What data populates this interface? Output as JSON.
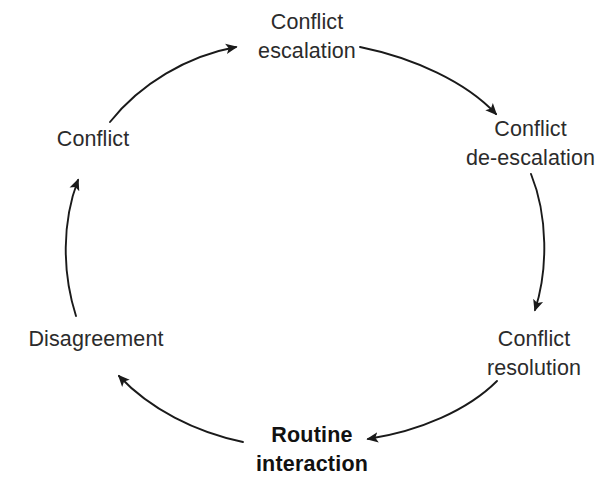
{
  "diagram": {
    "type": "cycle",
    "direction": "clockwise",
    "background_color": "#ffffff",
    "stroke_color": "#1a1a1a",
    "text_color": "#2b2b2b",
    "emphasis_text_color": "#111111",
    "nodes": [
      {
        "id": "routine-interaction",
        "lines": [
          "Routine",
          "interaction"
        ],
        "emphasis": true,
        "position": "bottom"
      },
      {
        "id": "conflict",
        "lines": [
          "Conflict"
        ],
        "emphasis": false,
        "position": "upper-left"
      },
      {
        "id": "conflict-escalation",
        "lines": [
          "Conflict",
          "escalation"
        ],
        "emphasis": false,
        "position": "top"
      },
      {
        "id": "conflict-de-escalation",
        "lines": [
          "Conflict",
          "de-escalation"
        ],
        "emphasis": false,
        "position": "upper-right"
      },
      {
        "id": "conflict-resolution",
        "lines": [
          "Conflict",
          "resolution"
        ],
        "emphasis": false,
        "position": "lower-right"
      },
      {
        "id": "disagreement",
        "lines": [
          "Disagreement"
        ],
        "emphasis": false,
        "position": "lower-left"
      }
    ],
    "edges": [
      {
        "id": "edge-disagreement-to-conflict",
        "from": "disagreement",
        "to": "conflict"
      },
      {
        "id": "edge-conflict-to-escalation",
        "from": "conflict",
        "to": "conflict-escalation"
      },
      {
        "id": "edge-escalation-to-de-escalation",
        "from": "conflict-escalation",
        "to": "conflict-de-escalation"
      },
      {
        "id": "edge-de-escalation-to-resolution",
        "from": "conflict-de-escalation",
        "to": "conflict-resolution"
      },
      {
        "id": "edge-resolution-to-routine",
        "from": "conflict-resolution",
        "to": "routine-interaction"
      },
      {
        "id": "edge-routine-to-disagreement",
        "from": "routine-interaction",
        "to": "disagreement"
      }
    ]
  }
}
